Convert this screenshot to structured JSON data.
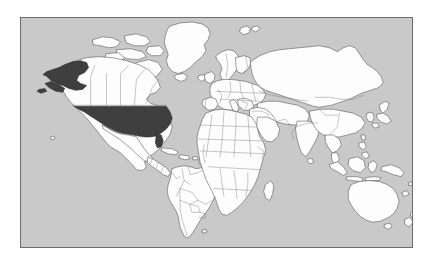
{
  "figure": {
    "frame": {
      "border_color": "#6d6d6d",
      "x": 20,
      "y": 17,
      "width": 393,
      "height": 231
    }
  },
  "colors": {
    "page_background": "#ffffff",
    "ocean": "#c9c9c9",
    "land_fill": "#fdfdfd",
    "land_stroke": "#4f4f4f",
    "country_border": "#6f6f6f",
    "highlight_fill": "#3f3f3f",
    "highlight_stroke": "#2a2a2a"
  },
  "map": {
    "projection": "equirectangular",
    "lon_range": [
      -180,
      180
    ],
    "lat_range": [
      -90,
      90
    ],
    "graticule": false,
    "labels": [],
    "legend": []
  },
  "highlighted_regions": [
    {
      "name": "United States (contiguous)",
      "fill": "#3f3f3f"
    },
    {
      "name": "Alaska",
      "fill": "#3f3f3f"
    }
  ],
  "regions": [
    {
      "name": "North America",
      "fill": "#fdfdfd"
    },
    {
      "name": "South America",
      "fill": "#fdfdfd"
    },
    {
      "name": "Europe",
      "fill": "#fdfdfd"
    },
    {
      "name": "Africa",
      "fill": "#fdfdfd"
    },
    {
      "name": "Asia",
      "fill": "#fdfdfd"
    },
    {
      "name": "Australia",
      "fill": "#fdfdfd"
    },
    {
      "name": "Greenland",
      "fill": "#fdfdfd"
    },
    {
      "name": "Iceland",
      "fill": "#fdfdfd"
    },
    {
      "name": "Madagascar",
      "fill": "#fdfdfd"
    },
    {
      "name": "Japan",
      "fill": "#fdfdfd"
    },
    {
      "name": "New Zealand",
      "fill": "#fdfdfd"
    },
    {
      "name": "Indonesia",
      "fill": "#fdfdfd"
    },
    {
      "name": "Philippines",
      "fill": "#fdfdfd"
    },
    {
      "name": "United Kingdom",
      "fill": "#fdfdfd"
    },
    {
      "name": "Ireland",
      "fill": "#fdfdfd"
    },
    {
      "name": "Sri Lanka",
      "fill": "#fdfdfd"
    },
    {
      "name": "Cuba",
      "fill": "#fdfdfd"
    },
    {
      "name": "Papua New Guinea",
      "fill": "#fdfdfd"
    },
    {
      "name": "Taiwan",
      "fill": "#fdfdfd"
    },
    {
      "name": "Svalbard",
      "fill": "#fdfdfd"
    }
  ]
}
